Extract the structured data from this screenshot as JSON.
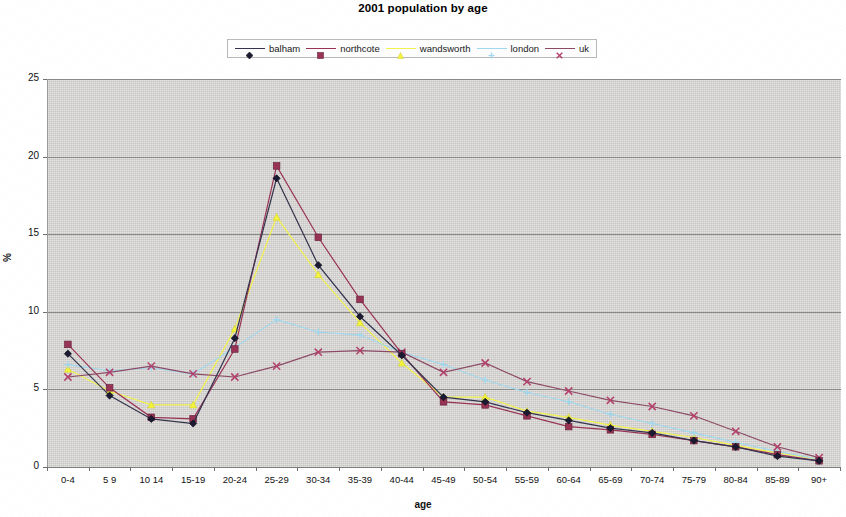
{
  "chart_data": {
    "type": "line",
    "title": "2001 population by age",
    "xlabel": "age",
    "ylabel": "%",
    "ylim": [
      0,
      25
    ],
    "yticks": [
      0,
      5,
      10,
      15,
      20,
      25
    ],
    "grid": true,
    "legend_position": "top-center",
    "categories": [
      "0-4",
      "5 9",
      "10 14",
      "15-19",
      "20-24",
      "25-29",
      "30-34",
      "35-39",
      "40-44",
      "45-49",
      "50-54",
      "55-59",
      "60-64",
      "65-69",
      "70-74",
      "75-79",
      "80-84",
      "85-89",
      "90+"
    ],
    "series": [
      {
        "name": "balham",
        "color": "#33334d",
        "marker": "diamond",
        "marker_color": "#1a1a33",
        "values": [
          7.3,
          4.6,
          3.1,
          2.8,
          8.3,
          18.6,
          13.0,
          9.7,
          7.2,
          4.5,
          4.2,
          3.5,
          3.0,
          2.5,
          2.2,
          1.7,
          1.3,
          0.7,
          0.4
        ]
      },
      {
        "name": "northcote",
        "color": "#993355",
        "marker": "square",
        "marker_color": "#993355",
        "values": [
          7.9,
          5.1,
          3.2,
          3.1,
          7.6,
          19.4,
          14.8,
          10.8,
          7.3,
          4.2,
          4.0,
          3.3,
          2.6,
          2.4,
          2.1,
          1.7,
          1.3,
          0.8,
          0.4
        ]
      },
      {
        "name": "wandsworth",
        "color": "#f2f24d",
        "marker": "triangle",
        "marker_color": "#f5f53c",
        "values": [
          6.3,
          4.9,
          4.0,
          4.0,
          8.9,
          16.1,
          12.4,
          9.3,
          6.7,
          4.5,
          4.5,
          3.6,
          3.2,
          2.7,
          2.3,
          1.9,
          1.4,
          0.9,
          0.5
        ]
      },
      {
        "name": "london",
        "color": "#9fd8ef",
        "marker": "cross",
        "marker_color": "#9fd8ef",
        "values": [
          6.6,
          6.2,
          6.4,
          6.0,
          7.7,
          9.5,
          8.7,
          8.5,
          7.4,
          6.6,
          5.6,
          4.8,
          4.2,
          3.4,
          2.8,
          2.2,
          1.6,
          1.0,
          0.5
        ]
      },
      {
        "name": "uk",
        "color": "#8c4a66",
        "marker": "x",
        "marker_color": "#b3406b",
        "values": [
          5.8,
          6.1,
          6.5,
          6.0,
          5.8,
          6.5,
          7.4,
          7.5,
          7.4,
          6.1,
          6.7,
          5.5,
          4.9,
          4.3,
          3.9,
          3.3,
          2.3,
          1.3,
          0.6
        ]
      }
    ]
  },
  "legend": {
    "entries": [
      {
        "label": "balham"
      },
      {
        "label": "northcote"
      },
      {
        "label": "wandsworth"
      },
      {
        "label": "london"
      },
      {
        "label": "uk"
      }
    ]
  }
}
